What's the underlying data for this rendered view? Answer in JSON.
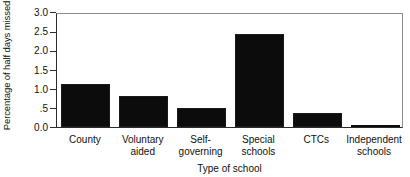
{
  "chart_data": {
    "type": "bar",
    "title": "",
    "xlabel": "Type of school",
    "ylabel": "Percentage of half days missed",
    "categories": [
      "County",
      "Voluntary\naided",
      "Self-\ngoverning",
      "Special\nschools",
      "CTCs",
      "Independent\nschools"
    ],
    "values": [
      1.12,
      0.81,
      0.5,
      2.42,
      0.37,
      0.03
    ],
    "ylim": [
      0.0,
      3.0
    ],
    "ytick_labels": [
      "3.0",
      "2.5",
      "2.0",
      "1.5",
      "1.0",
      ".5",
      "0.0"
    ],
    "ytick_values": [
      3.0,
      2.5,
      2.0,
      1.5,
      1.0,
      0.5,
      0.0
    ],
    "grid": false,
    "legend": false,
    "bar_color": "#0c0c0c",
    "axis_color": "#2b2b2b"
  }
}
